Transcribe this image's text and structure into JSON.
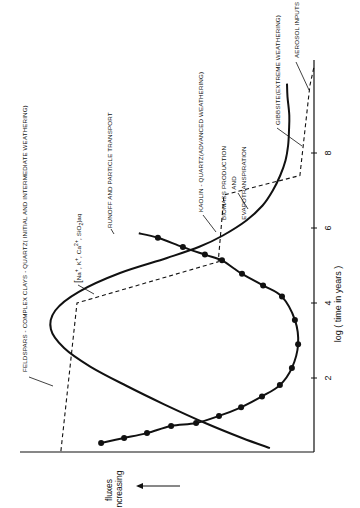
{
  "chart_data": {
    "type": "line",
    "orientation": "rotated-90-ccw",
    "title": "",
    "xlabel": "log (time in years)",
    "ylabel": "fluxes increasing",
    "xlim": [
      0,
      10.3
    ],
    "ylim": [
      0,
      10
    ],
    "xticks": [
      2,
      4,
      6,
      8
    ],
    "xtick_labels": [
      "2",
      "4",
      "6",
      "8"
    ],
    "grid": false,
    "series": [
      {
        "name": "Runoff and particle transport",
        "style": "solid-with-markers",
        "x": [
          0.27,
          0.4,
          0.53,
          0.72,
          0.8,
          0.99,
          1.22,
          1.51,
          1.81,
          2.27,
          2.9,
          3.55,
          4.17,
          4.47,
          4.78,
          4.92,
          5.14,
          5.29,
          5.49,
          5.74,
          5.86
        ],
        "y": [
          7.24,
          6.46,
          5.68,
          4.86,
          4.01,
          3.23,
          2.48,
          1.77,
          1.16,
          0.75,
          0.54,
          0.65,
          1.09,
          1.73,
          2.45,
          2.72,
          3.13,
          3.71,
          4.46,
          5.31,
          5.96
        ],
        "markers_x": [
          0.27,
          0.4,
          0.53,
          0.72,
          0.8,
          0.99,
          1.22,
          1.51,
          1.81,
          2.27,
          2.9,
          3.55,
          4.17,
          4.47,
          4.78,
          5.14,
          5.29,
          5.49,
          5.74
        ],
        "markers_y": [
          7.24,
          6.46,
          5.68,
          4.86,
          4.01,
          3.23,
          2.48,
          1.77,
          1.16,
          0.75,
          0.54,
          0.65,
          1.09,
          1.73,
          2.45,
          3.13,
          3.71,
          4.46,
          5.31
        ]
      },
      {
        "name": "[Na+, K+, Ca2+, SiO2]aq",
        "style": "solid",
        "x": [
          0.13,
          0.4,
          0.8,
          1.3,
          1.8,
          2.3,
          2.8,
          3.3,
          3.8,
          4.3,
          4.8,
          5.2,
          5.5,
          5.8,
          6.2,
          6.6,
          7.0,
          7.4,
          7.8,
          8.2,
          8.6,
          9.0,
          9.5,
          9.85
        ],
        "y": [
          1.5,
          2.45,
          3.7,
          5.1,
          6.4,
          7.6,
          8.5,
          8.95,
          8.8,
          8.0,
          6.6,
          5.0,
          3.9,
          3.1,
          2.3,
          1.75,
          1.4,
          1.15,
          0.97,
          0.88,
          0.85,
          0.84,
          0.9,
          0.92
        ]
      },
      {
        "name": "Mineral weathering stages",
        "style": "dashed-step",
        "x": [
          0.05,
          4.0,
          5.1,
          6.88,
          7.4,
          9.8,
          10.3
        ],
        "y": [
          8.61,
          8.06,
          3.26,
          3.06,
          0.48,
          0.14,
          0.0
        ]
      }
    ],
    "annotations": [
      {
        "text": "FELDSPARS-COMPLEX CLAYS-QUARTZ(INITIAL AND INTERMEDIATE WEATHERING)",
        "points_to": "dashed-step segment, log t ≈ 1"
      },
      {
        "text": "RUNOFF AND PARTICLE TRANSPORT",
        "points_to": "Runoff and particle transport curve"
      },
      {
        "text": "[Na⁺, K⁺, Ca²⁺, SiO₂]aq",
        "points_to": "solid curve near log t ≈ 4.5"
      },
      {
        "text": "KAOLIN-QUARTZ(ADVANCED WEATHERING)",
        "points_to": "dashed-step segment, log t ≈ 5.5"
      },
      {
        "text": "BIOMASS PRODUCTION AND EVAPOTRANSPIRATION",
        "points_to": "dashed-step corner near log t ≈ 6.8"
      },
      {
        "text": "GIBBSITE(EXTREME WEATHERING)",
        "points_to": "dashed-step segment, log t ≈ 8.3"
      },
      {
        "text": "AEROSOL INPUTS",
        "points_to": "dashed-step corner near log t ≈ 9.8"
      }
    ],
    "legend": "none (annotations with arrows)"
  },
  "labels": {
    "feldspars": "FELDSPARS - COMPLEX  CLAYS - QUARTZ( INITIAL AND INTERMEDIATE WEATHERING)",
    "runoff": "RUNOFF AND PARTICLE  TRANSPORT",
    "solutes_open": "[",
    "solutes_na": "Na",
    "solutes_k": "K",
    "solutes_ca": "Ca",
    "solutes_sio": "SiO",
    "solutes_close": "]aq",
    "kaolin": "KAOLIN - QUARTZ(ADVANCED WEATHERING)",
    "biomass_1": "BIOMASS PRODUCTION",
    "biomass_2": "AND",
    "biomass_3": "EVAPOTRANSPIRATION",
    "gibbsite": "GIBBSITE(EXTREME WEATHERING)",
    "aerosol": "AEROSOL  INPUTS",
    "axis_x_title": "log ( time   in   years )",
    "axis_y_1": "fluxes",
    "axis_y_2": "increasing"
  }
}
